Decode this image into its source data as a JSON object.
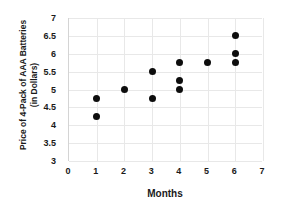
{
  "chart_data": {
    "type": "scatter",
    "title": "",
    "xlabel": "Months",
    "ylabel_line1": "Price of 4-Pack of AAA Batteries",
    "ylabel_line2": "(in Dollars)",
    "xlim": [
      0,
      7
    ],
    "ylim": [
      3,
      7
    ],
    "xticks": [
      0,
      1,
      2,
      3,
      4,
      5,
      6,
      7
    ],
    "xtick_labels": [
      "0",
      "1",
      "2",
      "3",
      "4",
      "5",
      "6",
      "7"
    ],
    "yticks": [
      3,
      3.5,
      4,
      4.5,
      5,
      5.5,
      6,
      6.5,
      7
    ],
    "ytick_labels": [
      "3",
      "3.5",
      "4",
      "4.5",
      "5",
      "5.5",
      "6",
      "6.5",
      "7"
    ],
    "grid": true,
    "legend": false,
    "marker_color": "#0d0d0d",
    "gridline_color": "#e8e8e8",
    "points": [
      {
        "x": 1,
        "y": 4.75
      },
      {
        "x": 1,
        "y": 4.25
      },
      {
        "x": 2,
        "y": 5.0
      },
      {
        "x": 3,
        "y": 5.5
      },
      {
        "x": 3,
        "y": 4.75
      },
      {
        "x": 4,
        "y": 5.75
      },
      {
        "x": 4,
        "y": 5.25
      },
      {
        "x": 4,
        "y": 5.0
      },
      {
        "x": 5,
        "y": 5.75
      },
      {
        "x": 6,
        "y": 6.5
      },
      {
        "x": 6,
        "y": 6.0
      },
      {
        "x": 6,
        "y": 5.75
      }
    ]
  }
}
